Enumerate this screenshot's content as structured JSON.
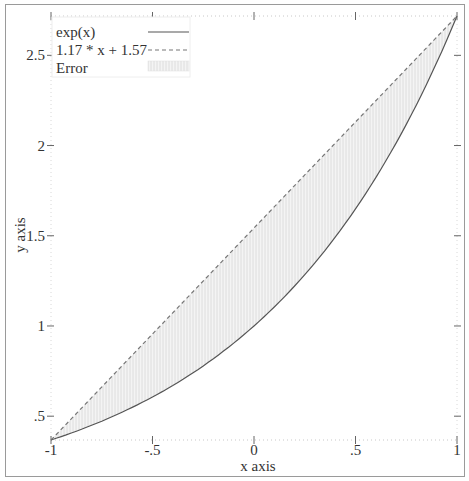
{
  "chart_data": {
    "type": "line",
    "title": "",
    "xlabel": "x axis",
    "ylabel": "y axis",
    "xlim": [
      -1,
      1
    ],
    "ylim": [
      0.368,
      2.718
    ],
    "grid": false,
    "legend_position": "upper-left",
    "x_ticks": [
      {
        "value": -1,
        "label": "-1"
      },
      {
        "value": -0.5,
        "label": "-.5"
      },
      {
        "value": 0,
        "label": "0"
      },
      {
        "value": 0.5,
        "label": ".5"
      },
      {
        "value": 1,
        "label": "1"
      }
    ],
    "y_ticks": [
      {
        "value": 0.5,
        "label": ".5"
      },
      {
        "value": 1,
        "label": "1"
      },
      {
        "value": 1.5,
        "label": "1.5"
      },
      {
        "value": 2,
        "label": "2"
      },
      {
        "value": 2.5,
        "label": "2.5"
      }
    ],
    "series": [
      {
        "name": "exp(x)",
        "style": "solid",
        "color": "#555555",
        "x": [
          -1,
          -0.75,
          -0.5,
          -0.25,
          0,
          0.25,
          0.5,
          0.75,
          1
        ],
        "values": [
          0.368,
          0.472,
          0.607,
          0.779,
          1.0,
          1.284,
          1.649,
          2.117,
          2.718
        ]
      },
      {
        "name": "1.17 * x + 1.57",
        "style": "dashed",
        "color": "#777777",
        "x": [
          -1,
          1
        ],
        "values": [
          0.4,
          2.74
        ]
      },
      {
        "name": "Error",
        "style": "fill-hatched",
        "color": "#cfcfcf",
        "description": "shaded region between exp(x) and the linear approximation"
      }
    ]
  },
  "legend": {
    "items": [
      {
        "label": "exp(x)"
      },
      {
        "label": "1.17 * x + 1.57"
      },
      {
        "label": "Error"
      }
    ]
  },
  "axes": {
    "x_title": "x axis",
    "y_title": "y axis",
    "x_tick_labels": [
      "-1",
      "-.5",
      "0",
      ".5",
      "1"
    ],
    "y_tick_labels": [
      ".5",
      "1",
      "1.5",
      "2",
      "2.5"
    ]
  }
}
